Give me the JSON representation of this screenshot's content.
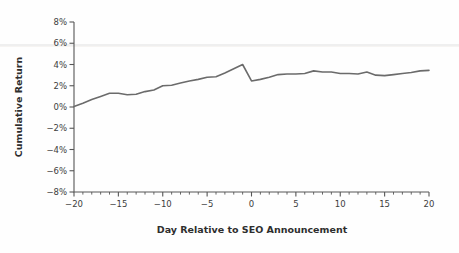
{
  "figure": {
    "background_color": "#fefefe",
    "line_color": "#6b6b6b",
    "axis_color": "#565656",
    "text_color": "#3d3d3d"
  },
  "chart_data": {
    "type": "line",
    "title": "",
    "xlabel": "Day Relative to SEO Announcement",
    "ylabel": "Cumulative Return",
    "xlim": [
      -20,
      20
    ],
    "ylim": [
      -8,
      8
    ],
    "grid": false,
    "legend": "none",
    "x_ticks": [
      -20,
      -15,
      -10,
      -5,
      0,
      5,
      10,
      15,
      20
    ],
    "x_tick_labels": [
      "−20",
      "−15",
      "−10",
      "−5",
      "0",
      "5",
      "10",
      "15",
      "20"
    ],
    "x_minor_tick_step": 1,
    "y_ticks": [
      -8,
      -6,
      -4,
      -2,
      0,
      2,
      4,
      6,
      8
    ],
    "y_tick_labels": [
      "−8%",
      "−6%",
      "−4%",
      "−2%",
      "0%",
      "2%",
      "4%",
      "6%",
      "8%"
    ],
    "y_unit": "%",
    "x": [
      -20,
      -19,
      -18,
      -17,
      -16,
      -15,
      -14,
      -13,
      -12,
      -11,
      -10,
      -9,
      -8,
      -7,
      -6,
      -5,
      -4,
      -3,
      -2,
      -1,
      0,
      1,
      2,
      3,
      4,
      5,
      6,
      7,
      8,
      9,
      10,
      11,
      12,
      13,
      14,
      15,
      16,
      17,
      18,
      19,
      20
    ],
    "series": [
      {
        "name": "Cumulative Return",
        "color": "#6b6b6b",
        "values": [
          0.05,
          0.35,
          0.7,
          1.0,
          1.3,
          1.3,
          1.15,
          1.2,
          1.45,
          1.6,
          2.0,
          2.05,
          2.25,
          2.45,
          2.6,
          2.8,
          2.85,
          3.2,
          3.6,
          4.0,
          2.45,
          2.6,
          2.8,
          3.05,
          3.1,
          3.1,
          3.15,
          3.4,
          3.3,
          3.3,
          3.15,
          3.15,
          3.1,
          3.3,
          3.0,
          2.95,
          3.05,
          3.15,
          3.25,
          3.4,
          3.45
        ]
      }
    ],
    "annotations": []
  }
}
